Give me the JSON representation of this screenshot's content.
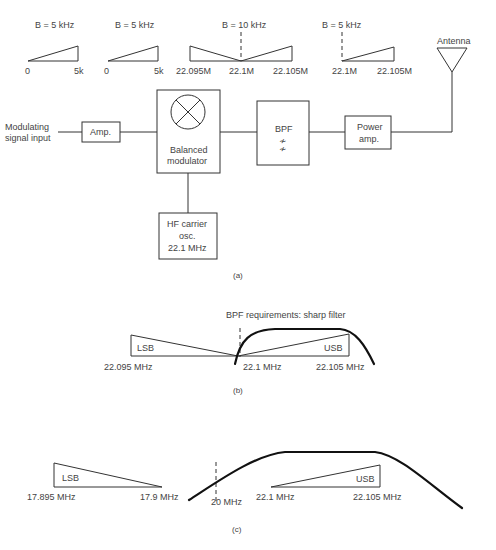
{
  "spectra_top": [
    {
      "bandwidth": "B = 5 kHz",
      "left": "0",
      "right": "5k"
    },
    {
      "bandwidth": "B = 5 kHz",
      "left": "0",
      "right": "5k"
    },
    {
      "bandwidth": "B = 10 kHz",
      "left": "22.095M",
      "center": "22.1M",
      "right": "22.105M"
    },
    {
      "bandwidth": "B = 5 kHz",
      "left": "22.1M",
      "right": "22.105M"
    }
  ],
  "blocks": {
    "input_label_1": "Modulating",
    "input_label_2": "signal input",
    "amp": "Amp.",
    "modulator_1": "Balanced",
    "modulator_2": "modulator",
    "bpf": "BPF",
    "power_amp_1": "Power",
    "power_amp_2": "amp.",
    "antenna": "Antenna",
    "osc_1": "HF carrier",
    "osc_2": "osc.",
    "osc_3": "22.1 MHz"
  },
  "captions": {
    "a": "(a)",
    "b": "(b)",
    "c": "(c)"
  },
  "panel_b": {
    "title": "BPF requirements: sharp filter",
    "lsb": "LSB",
    "usb": "USB",
    "f_low": "22.095 MHz",
    "f_carrier": "22.1 MHz",
    "f_high": "22.105 MHz"
  },
  "panel_c": {
    "lsb": "LSB",
    "usb": "USB",
    "lsb_low": "17.895 MHz",
    "lsb_high": "17.9 MHz",
    "carrier": "20 MHz",
    "usb_low": "22.1 MHz",
    "usb_high": "22.105 MHz"
  }
}
